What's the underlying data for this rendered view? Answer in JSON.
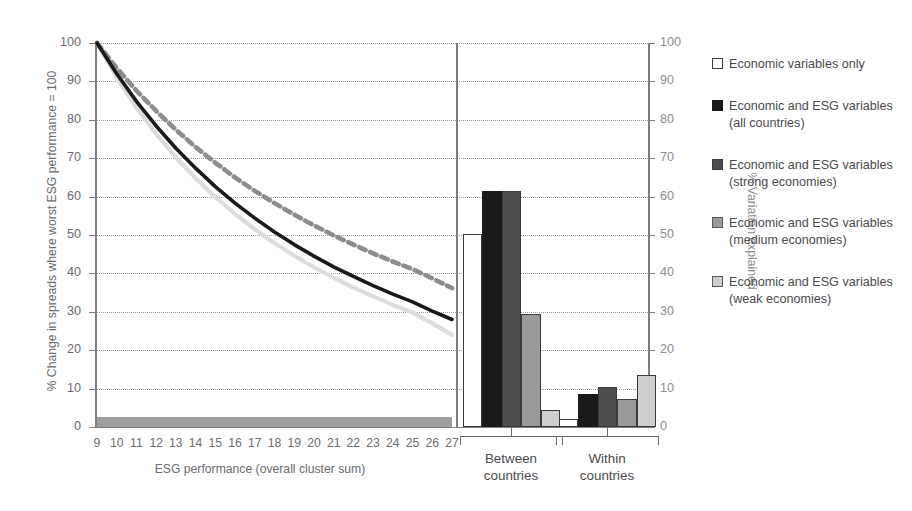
{
  "chart_data": {
    "type": "line+bar",
    "title": "",
    "left_panel": {
      "type": "line",
      "xlabel": "ESG performance (overall cluster sum)",
      "ylabel": "% Change in spreads where worst ESG performance = 100",
      "xlim": [
        9,
        27
      ],
      "ylim": [
        0,
        100
      ],
      "xticks": [
        "9",
        "10",
        "11",
        "12",
        "13",
        "14",
        "15",
        "16",
        "17",
        "18",
        "19",
        "20",
        "21",
        "22",
        "23",
        "24",
        "25",
        "26",
        "27"
      ],
      "yticks": [
        "0",
        "10",
        "20",
        "30",
        "40",
        "50",
        "60",
        "70",
        "80",
        "90",
        "100"
      ],
      "grid": true,
      "x": [
        9,
        10,
        11,
        12,
        13,
        14,
        15,
        16,
        17,
        18,
        19,
        20,
        21,
        22,
        23,
        24,
        25,
        26,
        27
      ],
      "series": [
        {
          "name": "Economic and ESG variables (all countries)",
          "style": "solid",
          "color": "#1a1a1a",
          "values": [
            100.0,
            92.0,
            84.8,
            78.4,
            72.6,
            67.4,
            62.6,
            58.3,
            54.4,
            50.8,
            47.5,
            44.5,
            41.7,
            39.2,
            36.8,
            34.6,
            32.6,
            30.2,
            28.0
          ]
        },
        {
          "name": "Economic and ESG variables (strong economies)",
          "style": "dashed",
          "color": "#8d8d8f",
          "values": [
            100.0,
            93.5,
            87.6,
            82.3,
            77.4,
            72.9,
            68.8,
            65.0,
            61.5,
            58.3,
            55.3,
            52.5,
            49.9,
            47.5,
            45.2,
            43.1,
            41.1,
            38.7,
            36.2
          ]
        },
        {
          "name": "Economic and ESG variables (medium economies)",
          "style": "solid",
          "color": "#dcdcdc",
          "values": [
            100.0,
            91.0,
            83.2,
            76.3,
            70.2,
            64.8,
            59.9,
            55.5,
            51.5,
            47.9,
            44.6,
            41.6,
            38.9,
            36.3,
            34.0,
            31.8,
            29.8,
            27.0,
            24.0
          ]
        }
      ],
      "baseline_band": {
        "name": "Economic variables only",
        "color": "#9e9e9e",
        "value": 1.5
      }
    },
    "right_panel": {
      "type": "bar",
      "ylabel": "% Variation explained",
      "ylim": [
        0,
        100
      ],
      "yticks": [
        "0",
        "10",
        "20",
        "30",
        "40",
        "50",
        "60",
        "70",
        "80",
        "90",
        "100"
      ],
      "grid": true,
      "groups": [
        {
          "label_line1": "Between",
          "label_line2": "countries",
          "values": [
            50.3,
            61.5,
            61.4,
            29.4,
            4.4
          ]
        },
        {
          "label_line1": "Within",
          "label_line2": "countries",
          "values": [
            2.2,
            8.5,
            10.4,
            7.3,
            13.6
          ]
        }
      ],
      "series_names": [
        "Economic variables only",
        "Economic and ESG variables (all countries)",
        "Economic and ESG variables (strong economies)",
        "Economic and ESG variables (medium economies)",
        "Economic and ESG variables (weak economies)"
      ],
      "series_colors": [
        "#ffffff",
        "#1a1a1a",
        "#4d4d4d",
        "#9a9a9a",
        "#cfcfcf"
      ]
    },
    "legend": {
      "position": "right",
      "entries": [
        {
          "label": "Economic variables only",
          "color": "#ffffff",
          "border": "#3d3d3d"
        },
        {
          "label": "Economic and ESG variables (all countries)",
          "color": "#1a1a1a",
          "border": "#1a1a1a"
        },
        {
          "label": "Economic and ESG variables (strong economies)",
          "color": "#4d4d4d",
          "border": "#3d3d3d"
        },
        {
          "label": "Economic and ESG variables (medium economies)",
          "color": "#9a9a9a",
          "border": "#5a5a5a"
        },
        {
          "label": "Economic and ESG variables (weak economies)",
          "color": "#cfcfcf",
          "border": "#5a5a5a"
        }
      ]
    },
    "colors": {
      "axis": "#7d7d7f",
      "grid": "#9a9a9c",
      "text": "#6b6b6d",
      "text_dark": "#4a4a4c",
      "text_right_axis": "#8c8c8e"
    }
  }
}
